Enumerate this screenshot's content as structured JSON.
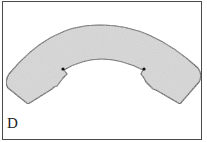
{
  "figure": {
    "label": "D",
    "colors": {
      "fill": "#cfcfcf",
      "stroke": "#2a2a2a",
      "frame": "#4a4a4a",
      "background": "#ffffff"
    }
  }
}
